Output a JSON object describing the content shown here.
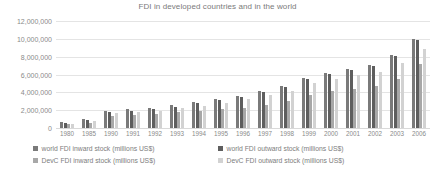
{
  "chart_data": {
    "type": "bar",
    "title": "FDI in developed countries and in the world",
    "xlabel": "",
    "ylabel": "",
    "ylim": [
      0,
      12000000
    ],
    "ytick_labels": [
      "12,000,000",
      "10,000,000",
      "8,000,000",
      "6,000,000",
      "4,000,000",
      "2,000,000",
      "0"
    ],
    "ytick_values": [
      12000000,
      10000000,
      8000000,
      6000000,
      4000000,
      2000000,
      0
    ],
    "grid": true,
    "legend_position": "bottom",
    "categories": [
      "1980",
      "1985",
      "1990",
      "1991",
      "1992",
      "1993",
      "1994",
      "1995",
      "1996",
      "1997",
      "1998",
      "1999",
      "2000",
      "2001",
      "2002",
      "2003",
      "2006"
    ],
    "series": [
      {
        "name": "world FDI  inward stock (millions US$)",
        "color": "#7a7a7a",
        "values": [
          700000,
          980000,
          1950000,
          2100000,
          2250000,
          2600000,
          2900000,
          3200000,
          3600000,
          4100000,
          4700000,
          5600000,
          6200000,
          6600000,
          7100000,
          8200000,
          10000000
        ]
      },
      {
        "name": "world FDI  outward stock (millions US$)",
        "color": "#5e5e5e",
        "values": [
          560000,
          900000,
          1800000,
          1950000,
          2100000,
          2400000,
          2750000,
          3100000,
          3500000,
          4000000,
          4600000,
          5500000,
          6100000,
          6500000,
          7000000,
          8100000,
          9900000
        ]
      },
      {
        "name": "DevC FDI  inward stock (millions US$)",
        "color": "#a8a8a8",
        "values": [
          400000,
          570000,
          1400000,
          1500000,
          1600000,
          1750000,
          1900000,
          2100000,
          2300000,
          2600000,
          3000000,
          3700000,
          4100000,
          4400000,
          4700000,
          5500000,
          7200000
        ]
      },
      {
        "name": "DevC FDI  outward stock (millions US$)",
        "color": "#d2d2d2",
        "values": [
          500000,
          840000,
          1700000,
          1850000,
          1950000,
          2200000,
          2500000,
          2800000,
          3200000,
          3650000,
          4200000,
          5000000,
          5500000,
          5900000,
          6300000,
          7300000,
          8900000
        ]
      }
    ]
  }
}
